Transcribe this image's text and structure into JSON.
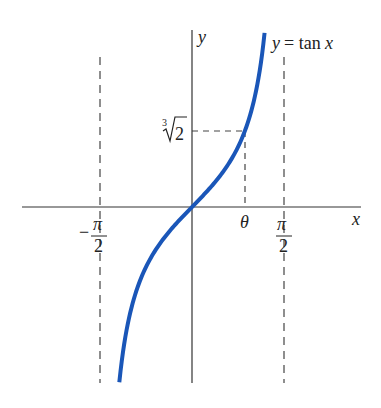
{
  "chart_data": {
    "type": "line",
    "title": "",
    "function": "y = tan x",
    "series": [
      {
        "name": "y = tan x",
        "color": "#1a56b8",
        "x_range": [
          -1.241,
          1.239
        ],
        "x": [
          -1.241,
          -1.2,
          -1.1,
          -1.0,
          -0.9,
          -0.8,
          -0.6,
          -0.4,
          -0.2,
          0,
          0.2,
          0.4,
          0.6,
          0.8,
          0.9,
          1.0,
          1.1,
          1.2,
          1.239
        ],
        "y": [
          -2.93,
          -2.572,
          -1.965,
          -1.557,
          -1.26,
          -1.03,
          -0.684,
          -0.423,
          -0.203,
          0,
          0.203,
          0.423,
          0.684,
          1.03,
          1.26,
          1.557,
          1.965,
          2.572,
          2.9
        ]
      }
    ],
    "xlabel": "x",
    "ylabel": "y",
    "xlim": [
      -2.17,
      2.87
    ],
    "ylim": [
      -2.93,
      2.95
    ],
    "grid": false,
    "legend": null,
    "asymptotes": [
      {
        "x": -1.5708,
        "label_num": "π",
        "label_den": "2",
        "sign": "−",
        "style": "dashed"
      },
      {
        "x": 1.5708,
        "label_num": "π",
        "label_den": "2",
        "sign": "",
        "style": "dashed"
      }
    ],
    "annotations": [
      {
        "type": "curve-label",
        "text_lhs": "y",
        "text_eq": " = tan",
        "text_var": "x"
      },
      {
        "type": "point",
        "x_label": "θ",
        "y_label_index": "3",
        "y_label_radicand": "2",
        "x": 0.8999,
        "y": 1.2599,
        "guides": "dashed"
      }
    ],
    "tick_labels_x": [
      "−π/2",
      "θ",
      "π/2"
    ],
    "tick_labels_y": [
      "∛2"
    ]
  },
  "colors": {
    "curve": "#1a56b8",
    "axes": "#333333",
    "dashes": "#444444",
    "text": "#222222"
  },
  "labels": {
    "x_axis": "x",
    "y_axis": "y",
    "curve_lhs": "y",
    "curve_eq": "= tan",
    "curve_var": "x",
    "theta": "θ",
    "pi": "π",
    "two": "2",
    "minus": "−",
    "root_index": "3",
    "root_radicand": "2"
  }
}
